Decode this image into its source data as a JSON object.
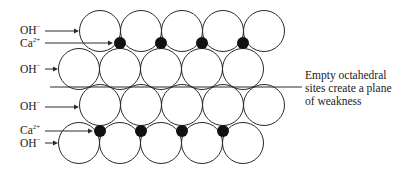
{
  "diagram": {
    "title": "",
    "colors": {
      "stroke": "#2a2a2a",
      "ion": "#111111",
      "background": "#ffffff"
    },
    "radius": 20.5,
    "layers": [
      {
        "name": "OH- layer top",
        "cy": 31,
        "cx": [
          100,
          141,
          182,
          223,
          264
        ]
      },
      {
        "name": "OH- layer 2",
        "cy": 69,
        "cx": [
          79,
          120,
          161,
          202,
          243
        ]
      },
      {
        "name": "OH- layer 3",
        "cy": 105,
        "cx": [
          100,
          141,
          182,
          223,
          264
        ]
      },
      {
        "name": "OH- layer bottom",
        "cy": 143,
        "cx": [
          79,
          120,
          161,
          202,
          243
        ]
      }
    ],
    "ca_ions": [
      {
        "cy": 43,
        "cx": [
          120,
          161,
          202,
          243
        ]
      },
      {
        "cy": 131,
        "cx": [
          100,
          141,
          182,
          223
        ]
      }
    ],
    "plane_line": {
      "x1": 50,
      "x2": 302,
      "y": 87
    },
    "labels": [
      {
        "id": "oh1",
        "base": "OH",
        "sup": "−",
        "x": 20,
        "y": 25,
        "arrow_y": 31,
        "arrow_to": 79
      },
      {
        "id": "ca1",
        "base": "Ca",
        "sup": "2+",
        "x": 20,
        "y": 38,
        "arrow_y": 43,
        "arrow_to": 113
      },
      {
        "id": "oh2",
        "base": "OH",
        "sup": "−",
        "x": 20,
        "y": 64,
        "arrow_y": 69,
        "arrow_to": 58
      },
      {
        "id": "oh3",
        "base": "OH",
        "sup": "−",
        "x": 20,
        "y": 101,
        "arrow_y": 107,
        "arrow_to": 79
      },
      {
        "id": "ca2",
        "base": "Ca",
        "sup": "2+",
        "x": 20,
        "y": 125,
        "arrow_y": 131,
        "arrow_to": 93
      },
      {
        "id": "oh4",
        "base": "OH",
        "sup": "−",
        "x": 20,
        "y": 138,
        "arrow_y": 143,
        "arrow_to": 58
      }
    ],
    "annotation": {
      "lines": [
        "Empty octahedral",
        "sites create a plane",
        "of weakness"
      ]
    }
  }
}
